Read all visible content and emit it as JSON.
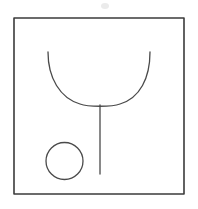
{
  "canvas": {
    "width": 198,
    "height": 209,
    "background_color": "#ffffff",
    "title": "Line drawing of a goblet shape and a circle inside a square frame"
  },
  "style": {
    "frame_color": "#3b3b3b",
    "frame_stroke_width": 1.6,
    "sketch_color": "#4a4a4a",
    "sketch_stroke_width": 1.3,
    "smudge_color": "#ebebeb"
  },
  "shapes": {
    "frame": {
      "name": "square frame border",
      "type": "rect",
      "x": 14,
      "y": 18,
      "width": 170,
      "height": 176
    },
    "goblet_bowl": {
      "name": "U-shaped bowl curve",
      "type": "path",
      "left_top_x": 48,
      "left_top_y": 52,
      "right_top_x": 150,
      "right_top_y": 52,
      "bottom_x": 100,
      "bottom_y": 106,
      "path": "M 48 52 C 48 78 60 98 80 104 C 88 107 112 107 120 104 C 140 98 150 78 150 52"
    },
    "goblet_stem": {
      "name": "vertical stem line",
      "type": "line",
      "x1": 100,
      "y1": 105,
      "x2": 100,
      "y2": 174
    },
    "circle": {
      "name": "small circle",
      "type": "circle",
      "cx": 64.5,
      "cy": 161,
      "r": 18.5
    },
    "smudge": {
      "name": "faint smudge mark",
      "type": "ellipse",
      "cx": 105,
      "cy": 6,
      "rx": 4,
      "ry": 3
    }
  }
}
